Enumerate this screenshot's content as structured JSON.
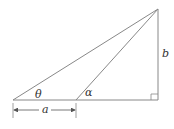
{
  "diagram": {
    "type": "geometry",
    "colors": {
      "line": "#888888",
      "text": "#333333",
      "background": "#ffffff"
    },
    "points": {
      "left_vertex": [
        13,
        100
      ],
      "mid_vertex": [
        76,
        100
      ],
      "right_angle_vertex": [
        158,
        100
      ],
      "apex": [
        158,
        9
      ]
    },
    "labels": {
      "theta": "θ",
      "alpha": "α",
      "a": "a",
      "b": "b"
    },
    "right_angle_marker": true
  }
}
